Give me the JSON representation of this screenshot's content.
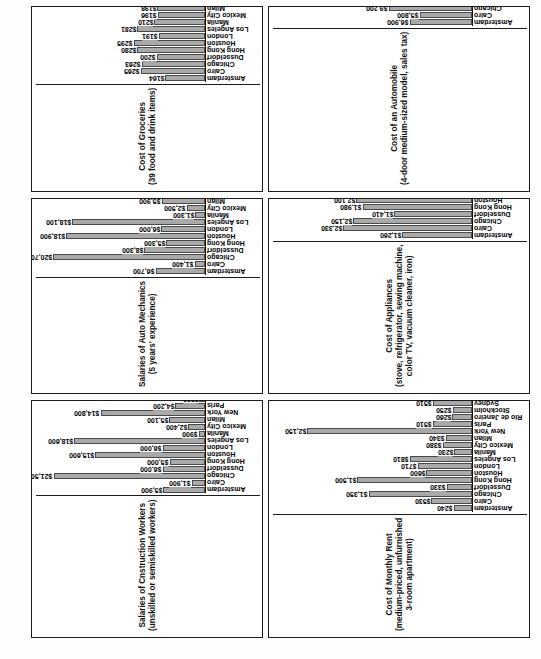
{
  "page": {
    "cities": [
      "Amsterdam",
      "Cairo",
      "Chicago",
      "Dusseldorf",
      "Hong Kong",
      "Houston",
      "London",
      "Los Angeles",
      "Manila",
      "Mexico City",
      "Milan",
      "New York",
      "Paris",
      "Rio de Janeiro",
      "Stockholm",
      "Sydney",
      "Tel Aviv",
      "Tokyo",
      "Toronto",
      "Zurich"
    ],
    "bar_color": "#a9a9a9",
    "bar_edge_color": "#4a4a4a"
  },
  "chart_data": [
    {
      "id": "groceries",
      "type": "bar",
      "title": "Cost of Groceries\n(39 food and drink items)",
      "xlabel": "",
      "ylabel": "",
      "grid": false,
      "legend": "none",
      "ylim": [
        0,
        700
      ],
      "categories": [
        "Amsterdam",
        "Cairo",
        "Chicago",
        "Dusseldorf",
        "Hong Kong",
        "Houston",
        "London",
        "Los Angeles",
        "Manila",
        "Mexico City",
        "Milan",
        "New York",
        "Paris",
        "Rio de Janeiro",
        "Stockholm",
        "Sydney",
        "Tel Aviv",
        "Tokyo",
        "Toronto",
        "Zurich"
      ],
      "values": [
        164,
        265,
        263,
        200,
        280,
        295,
        191,
        281,
        210,
        196,
        198,
        362,
        181,
        132,
        265,
        219,
        146,
        624,
        289,
        261
      ],
      "labels": [
        "$164",
        "$265",
        "$263",
        "$200",
        "$280",
        "$295",
        "$191",
        "$281",
        "$210",
        "$196",
        "$198",
        "$362",
        "$181",
        "$132",
        "$265",
        "$219",
        "$146",
        "$624",
        "$289",
        "$261"
      ]
    },
    {
      "id": "auto-mechanics",
      "type": "bar",
      "title": "Salaries of Auto Mechanics\n(5 years' experience)",
      "xlabel": "",
      "ylabel": "",
      "grid": false,
      "legend": "none",
      "ylim": [
        0,
        23000
      ],
      "categories": [
        "Amsterdam",
        "Cairo",
        "Chicago",
        "Dusseldorf",
        "Hong Kong",
        "Houston",
        "London",
        "Los Angeles",
        "Manila",
        "Mexico City",
        "Milan",
        "New York",
        "Paris",
        "Rio de Janeiro",
        "Stockholm",
        "Sydney",
        "Tel Aviv",
        "Tokyo",
        "Toronto",
        "Zurich"
      ],
      "values": [
        6700,
        1400,
        20700,
        8300,
        5300,
        18900,
        6000,
        18100,
        1300,
        2500,
        5900,
        19500,
        4900,
        1600,
        7300,
        9400,
        5100,
        10100,
        12800,
        12100
      ],
      "labels": [
        "$6,700",
        "$1,400",
        "$20,700",
        "$8,300",
        "$5,300",
        "$18,900",
        "$6,000",
        "$18,100",
        "$1,300",
        "$2,500",
        "$5,900",
        "$19,500",
        "$4,900",
        "$1,600",
        "$7,300",
        "$9,400",
        "$5,100",
        "$10,100",
        "$12,800",
        "$12,100"
      ]
    },
    {
      "id": "construction-workers",
      "type": "bar",
      "title": "Salaries of Cnstruction Workers\n(unskilled or semiskilled workers)",
      "xlabel": "",
      "ylabel": "",
      "grid": false,
      "legend": "none",
      "ylim": [
        0,
        24000
      ],
      "categories": [
        "Amsterdam",
        "Cairo",
        "Chicago",
        "Dusseldorf",
        "Hong Kong",
        "Houston",
        "London",
        "Los Angeles",
        "Manila",
        "Mexico City",
        "Milan",
        "New York",
        "Paris",
        "Rio de Janeiro",
        "Stockholm",
        "Sydney",
        "Tel Aviv",
        "Tokyo",
        "Toronto",
        "Zurich"
      ],
      "values": [
        5900,
        1900,
        21500,
        6000,
        5000,
        15600,
        6000,
        18600,
        900,
        2400,
        5100,
        14800,
        4200,
        800,
        7300,
        9700,
        2900,
        10800,
        15800,
        10300
      ],
      "labels": [
        "$5,900",
        "$1,900",
        "$21,500",
        "$6,000",
        "$5,000",
        "$15,600",
        "$6,000",
        "$18,600",
        "$900",
        "$2,400",
        "$5,100",
        "$14,800",
        "$4,200",
        "$800",
        "$7,300",
        "$9,700",
        "$2,900",
        "$10,800",
        "$15,800",
        "$10,300"
      ]
    },
    {
      "id": "automobile",
      "type": "bar",
      "title": "Cost of an Automobile\n(4-door medium-sized model, sales tax)",
      "xlabel": "",
      "ylabel": "",
      "grid": false,
      "legend": "none",
      "ylim": [
        0,
        22000
      ],
      "categories": [
        "Amsterdam",
        "Cairo",
        "Chicago",
        "Dusseldorf",
        "Hong Kong",
        "Houston",
        "London",
        "Los Angeles",
        "Manila",
        "Mexico City",
        "Milan",
        "New York",
        "Paris",
        "Rio de Janeiro",
        "Stockholm",
        "Sydney",
        "Tel Aviv",
        "Tokyo",
        "Toronto",
        "Zurich"
      ],
      "values": [
        6900,
        5800,
        9200,
        5600,
        13500,
        8600,
        7300,
        7500,
        7600,
        11100,
        8300,
        7600,
        6900,
        5800,
        8400,
        7100,
        19800,
        5500,
        9000,
        6100
      ],
      "labels": [
        "$6,900",
        "$5,800",
        "$9,200",
        "$5,600",
        "$13,500",
        "$8,600",
        "$7,300",
        "$7,500",
        "$7,600",
        "$11,100",
        "$8,300",
        "$7,600",
        "$6,900",
        "$5,800",
        "$8,400",
        "$7,100",
        "$19,800",
        "$5,500",
        "$9,000",
        "$6,100"
      ]
    },
    {
      "id": "appliances",
      "type": "bar",
      "title": "Cost of Appliances\n(stove, refrigerator, sewing machine,\ncolor TV, vacuum cleaner, iron)",
      "xlabel": "",
      "ylabel": "",
      "grid": false,
      "legend": "none",
      "ylim": [
        0,
        3600
      ],
      "categories": [
        "Amsterdam",
        "Cairo",
        "Chicago",
        "Dusseldorf",
        "Hong Kong",
        "Houston",
        "London",
        "Los Angeles",
        "Manila",
        "Mexico City",
        "Milan",
        "New York",
        "Paris",
        "Rio de Janeiro",
        "Stockholm",
        "Sydney",
        "Tel Aviv",
        "Tokyo",
        "Toronto",
        "Zurich"
      ],
      "values": [
        1260,
        2330,
        2150,
        1410,
        1980,
        2100,
        1680,
        2210,
        1680,
        2220,
        1480,
        3210,
        1780,
        1050,
        1580,
        2000,
        2920,
        2510,
        1900,
        1870
      ],
      "labels": [
        "$1,260",
        "$2,330",
        "$2,150",
        "$1,410",
        "$1,980",
        "$2,100",
        "$1,680",
        "$2,210",
        "$1,680",
        "$2,220",
        "$1,480",
        "$3,210",
        "$1,780",
        "$1,050",
        "$1,580",
        "$2,000",
        "$2,920",
        "$2,510",
        "$1,900",
        "$1,870"
      ]
    },
    {
      "id": "monthly-rent",
      "type": "bar",
      "title": "Cost of Monthly Rent\n(medium-priced, unfurnished\n3-room apartment)",
      "xlabel": "",
      "ylabel": "",
      "grid": false,
      "legend": "none",
      "ylim": [
        0,
        2600
      ],
      "categories": [
        "Amsterdam",
        "Cairo",
        "Chicago",
        "Dusseldorf",
        "Hong Kong",
        "Houston",
        "London",
        "Los Angeles",
        "Manila",
        "Mexico City",
        "Milan",
        "New York",
        "Paris",
        "Rio de Janeiro",
        "Stockholm",
        "Sydney",
        "Tel Aviv",
        "Tokyo",
        "Toronto",
        "Zurich"
      ],
      "values": [
        240,
        530,
        1350,
        330,
        1500,
        600,
        710,
        810,
        230,
        380,
        340,
        2150,
        510,
        260,
        250,
        510,
        230,
        2340,
        550,
        480
      ],
      "labels": [
        "$240",
        "$530",
        "$1,350",
        "$330",
        "$1,500",
        "$600",
        "$710",
        "$810",
        "$230",
        "$380",
        "$340",
        "$2,150",
        "$510",
        "$260",
        "$250",
        "$510",
        "$230",
        "$2,340",
        "$550",
        "$480"
      ]
    }
  ]
}
